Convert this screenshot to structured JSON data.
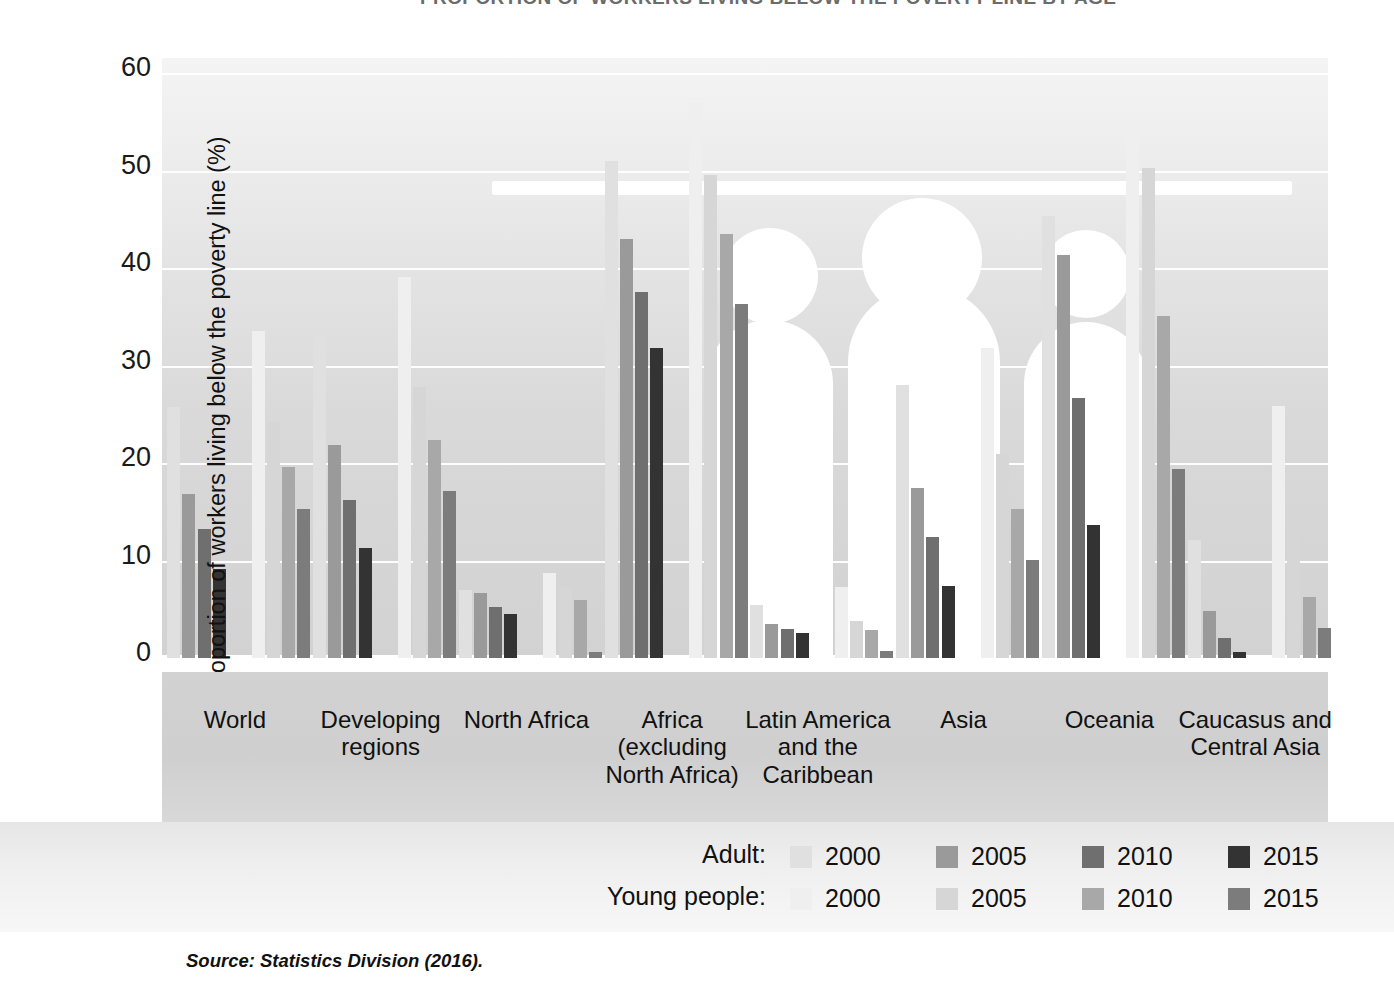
{
  "title": "PROPORTION OF WORKERS LIVING BELOW THE POVERTY LINE BY AGE",
  "source": "Source: Statistics Division (2016).",
  "y_axis_title": "Proportion of workers living below the poverty line (%)",
  "y_ticks": [
    "0",
    "10",
    "20",
    "30",
    "40",
    "50",
    "60"
  ],
  "legend": {
    "rows": [
      {
        "title": "Adult:",
        "items": [
          {
            "label": "2000",
            "color": "#e0e0e0"
          },
          {
            "label": "2005",
            "color": "#9a9a9a"
          },
          {
            "label": "2010",
            "color": "#6f6f6f"
          },
          {
            "label": "2015",
            "color": "#333333"
          }
        ]
      },
      {
        "title": "Young people:",
        "items": [
          {
            "label": "2000",
            "color": "#efefef"
          },
          {
            "label": "2005",
            "color": "#d6d6d6"
          },
          {
            "label": "2010",
            "color": "#a8a8a8"
          },
          {
            "label": "2015",
            "color": "#7c7c7c"
          }
        ]
      }
    ]
  },
  "chart_data": {
    "type": "bar",
    "title": "PROPORTION OF WORKERS LIVING BELOW THE POVERTY LINE BY AGE",
    "xlabel": "",
    "ylabel": "Proportion of workers living below the poverty line (%)",
    "ylim": [
      0,
      60
    ],
    "yticks": [
      0,
      10,
      20,
      30,
      40,
      50,
      60
    ],
    "grid": true,
    "legend_position": "bottom-right",
    "categories": [
      "World",
      "Developing regions",
      "North Africa",
      "Africa (excluding North Africa)",
      "Latin America and the Caribbean",
      "Asia",
      "Oceania",
      "Caucasus and Central Asia"
    ],
    "series": [
      {
        "name": "Adult: 2000",
        "color": "#e0e0e0",
        "values": [
          25.7,
          33.1,
          7.0,
          51.0,
          5.4,
          28.0,
          45.3,
          12.1
        ]
      },
      {
        "name": "Adult: 2005",
        "color": "#9a9a9a",
        "values": [
          16.8,
          21.8,
          6.7,
          43.0,
          3.5,
          17.4,
          41.3,
          4.8
        ]
      },
      {
        "name": "Adult: 2010",
        "color": "#6f6f6f",
        "values": [
          13.2,
          16.2,
          5.2,
          37.5,
          3.0,
          12.4,
          26.7,
          2.1
        ]
      },
      {
        "name": "Adult: 2015",
        "color": "#333333",
        "values": [
          9.1,
          11.3,
          4.5,
          31.8,
          2.6,
          7.4,
          13.6,
          0.6
        ]
      },
      {
        "name": "Young people: 2000",
        "color": "#efefef",
        "values": [
          33.5,
          39.1,
          8.7,
          56.9,
          7.3,
          31.8,
          54.2,
          25.8
        ]
      },
      {
        "name": "Young people: 2005",
        "color": "#d6d6d6",
        "values": [
          24.2,
          27.8,
          7.3,
          49.5,
          3.8,
          20.9,
          50.3,
          15.7
        ]
      },
      {
        "name": "Young people: 2010",
        "color": "#a8a8a8",
        "values": [
          19.6,
          22.4,
          5.9,
          43.5,
          2.9,
          15.3,
          35.1,
          6.3
        ]
      },
      {
        "name": "Young people: 2015",
        "color": "#7c7c7c",
        "values": [
          15.3,
          17.1,
          0.6,
          36.3,
          0.7,
          10.1,
          19.4,
          3.1
        ]
      }
    ]
  }
}
